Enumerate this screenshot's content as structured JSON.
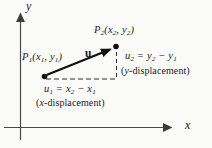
{
  "figure": {
    "background": "#fbfbf9",
    "ink": "#1a1a1a",
    "axis_ink": "#4a4a4a",
    "axes": {
      "x_label": "x",
      "y_label": "y"
    },
    "points": {
      "p1": {
        "label": "P_1(x_1, y_1)"
      },
      "p2": {
        "label": "P_2(x_2, y_2)"
      }
    },
    "vector": {
      "label": "u"
    },
    "components": {
      "x": {
        "equation": "u_1 = x_2 − x_1",
        "caption_open": "(",
        "caption_var": "x",
        "caption_rest": "-displacement)"
      },
      "y": {
        "equation": "u_2 = y_2 − y_1",
        "caption_open": "(",
        "caption_var": "y",
        "caption_rest": "-displacement)"
      }
    }
  }
}
